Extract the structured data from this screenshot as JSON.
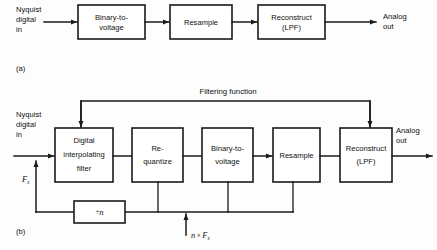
{
  "figure": {
    "parts": [
      {
        "tag": "(a)",
        "input_label_lines": [
          "Nyquist",
          "digital",
          "in"
        ],
        "output_label_lines": [
          "Analog",
          "out"
        ],
        "blocks": [
          {
            "name": "binary-to-voltage",
            "lines": [
              "Binary-to-",
              "voltage"
            ]
          },
          {
            "name": "resample",
            "lines": [
              "Resample"
            ]
          },
          {
            "name": "reconstruct-lpf",
            "lines": [
              "Reconstruct",
              "(LPF)"
            ]
          }
        ]
      },
      {
        "tag": "(b)",
        "input_label_lines": [
          "Nyquist",
          "digital",
          "in"
        ],
        "output_label_lines": [
          "Analog",
          "out"
        ],
        "feedback_label": "Filtering function",
        "blocks": [
          {
            "name": "digital-interpolating-filter",
            "lines": [
              "Digital",
              "interpolating",
              "filter"
            ]
          },
          {
            "name": "re-quantize",
            "lines": [
              "Re-",
              "quantize"
            ]
          },
          {
            "name": "binary-to-voltage",
            "lines": [
              "Binary-to-",
              "voltage"
            ]
          },
          {
            "name": "resample",
            "lines": [
              "Resample"
            ]
          },
          {
            "name": "reconstruct-lpf",
            "lines": [
              "Reconstruct",
              "(LPF)"
            ]
          }
        ],
        "divider_block": {
          "name": "divide-by-n",
          "symbol": "÷",
          "operand": "n"
        },
        "clock_sample_rate": {
          "base": "F",
          "subscript": "s"
        },
        "clock_oversample_rate": {
          "multiplier": "n",
          "times": "×",
          "base": "F",
          "subscript": "s"
        }
      }
    ]
  },
  "colors": {
    "ink": "#1a1a1a",
    "paper": "#fdfdfd",
    "box_fill": "#ffffff"
  }
}
